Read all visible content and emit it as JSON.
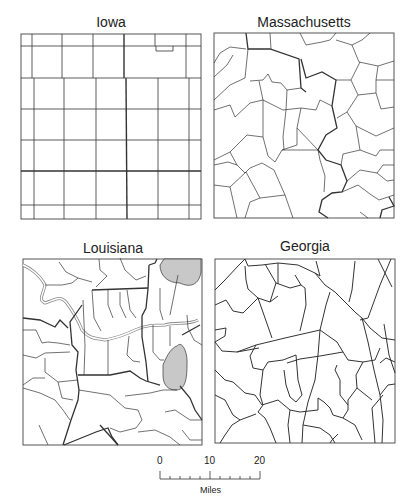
{
  "panels": [
    {
      "name": "Iowa"
    },
    {
      "name": "Massachusetts"
    },
    {
      "name": "Louisiana"
    },
    {
      "name": "Georgia"
    }
  ],
  "scale_bar": {
    "ticks": [
      "0",
      "10",
      "20"
    ],
    "unit": "Miles"
  },
  "colors": {
    "line": "#222222",
    "shaded": "#c8c8c8",
    "river": "#888888"
  }
}
